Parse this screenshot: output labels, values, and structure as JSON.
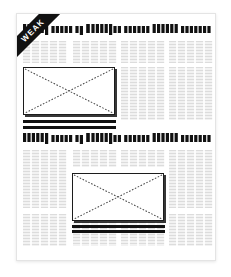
{
  "document": {
    "type": "newspaper-article-wireframe",
    "page_background": "#ffffff",
    "sheet_background": "#ffffff",
    "accent_color": "#111111",
    "text_block_color": "#e8e8e8"
  },
  "ribbon": {
    "label": "WEAK",
    "background": "#111111",
    "text_color": "#ffffff",
    "position": "top-left",
    "rotation_deg": -45
  },
  "headlines": [
    {
      "id": "headline-top",
      "rendering": "greeked",
      "text": "Uuuuuy uuuv uy Vuuuuyuu uuuuuu"
    },
    {
      "id": "headline-middle",
      "rendering": "greeked",
      "text": "Uuuuuy uuuv uy Vuuuuyuu uuuuuu"
    }
  ],
  "text_blocks": [
    {
      "id": "tb-r1-c1",
      "x": 6,
      "y": 27,
      "w": 44,
      "h": 22
    },
    {
      "id": "tb-r1-c2",
      "x": 56,
      "y": 27,
      "w": 44,
      "h": 22
    },
    {
      "id": "tb-r1-c3",
      "x": 104,
      "y": 27,
      "w": 44,
      "h": 22
    },
    {
      "id": "tb-r1-c4",
      "x": 152,
      "y": 27,
      "w": 44,
      "h": 22
    },
    {
      "id": "tb-r2-c3",
      "x": 104,
      "y": 53,
      "w": 44,
      "h": 53
    },
    {
      "id": "tb-r2-c4",
      "x": 152,
      "y": 53,
      "w": 44,
      "h": 53
    },
    {
      "id": "tb-r3-c1",
      "x": 6,
      "y": 136,
      "w": 44,
      "h": 58
    },
    {
      "id": "tb-r3-c2",
      "x": 56,
      "y": 136,
      "w": 44,
      "h": 17
    },
    {
      "id": "tb-r3-c3",
      "x": 104,
      "y": 136,
      "w": 44,
      "h": 17
    },
    {
      "id": "tb-r3-c4",
      "x": 152,
      "y": 136,
      "w": 44,
      "h": 58
    },
    {
      "id": "tb-r4-c1",
      "x": 6,
      "y": 200,
      "w": 44,
      "h": 32
    },
    {
      "id": "tb-r4-c2",
      "x": 56,
      "y": 208,
      "w": 44,
      "h": 24
    },
    {
      "id": "tb-r4-c3",
      "x": 104,
      "y": 208,
      "w": 44,
      "h": 24
    },
    {
      "id": "tb-r4-c4",
      "x": 152,
      "y": 200,
      "w": 44,
      "h": 32
    }
  ],
  "image_placeholders": [
    {
      "id": "image-placeholder-top",
      "x": 6,
      "y": 53,
      "w": 92,
      "h": 48
    },
    {
      "id": "image-placeholder-bottom",
      "x": 55,
      "y": 159,
      "w": 92,
      "h": 48
    }
  ],
  "rules": [
    {
      "id": "rule-under-top-image",
      "x": 6,
      "y": 106,
      "w": 93,
      "h": 3
    },
    {
      "id": "rule-above-headline-mid",
      "x": 6,
      "y": 112,
      "w": 93,
      "h": 3
    },
    {
      "id": "rule-under-bottom-image",
      "x": 55,
      "y": 211,
      "w": 93,
      "h": 3
    },
    {
      "id": "rule-bottom-accent",
      "x": 55,
      "y": 216,
      "w": 93,
      "h": 3
    }
  ]
}
